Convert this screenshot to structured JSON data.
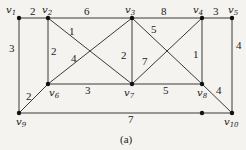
{
  "figure": {
    "caption": "(a)",
    "vertices": [
      {
        "id": "v1",
        "name": "v",
        "sub": "1",
        "x": 19,
        "y": 18,
        "lx": 6,
        "ly": 13
      },
      {
        "id": "v2",
        "name": "v",
        "sub": "2",
        "x": 48,
        "y": 18,
        "lx": 42,
        "ly": 13
      },
      {
        "id": "v3",
        "name": "v",
        "sub": "3",
        "x": 132,
        "y": 18,
        "lx": 125,
        "ly": 13
      },
      {
        "id": "v4",
        "name": "v",
        "sub": "4",
        "x": 202,
        "y": 18,
        "lx": 193,
        "ly": 13
      },
      {
        "id": "v5",
        "name": "v",
        "sub": "5",
        "x": 232,
        "y": 18,
        "lx": 228,
        "ly": 13
      },
      {
        "id": "v6",
        "name": "v",
        "sub": "6",
        "x": 48,
        "y": 84,
        "lx": 49,
        "ly": 96
      },
      {
        "id": "v7",
        "name": "v",
        "sub": "7",
        "x": 132,
        "y": 84,
        "lx": 124,
        "ly": 96
      },
      {
        "id": "v8",
        "name": "v",
        "sub": "8",
        "x": 202,
        "y": 84,
        "lx": 197,
        "ly": 96
      },
      {
        "id": "v9",
        "name": "v",
        "sub": "9",
        "x": 19,
        "y": 113,
        "lx": 16,
        "ly": 125
      },
      {
        "id": "v10",
        "name": "v",
        "sub": "10",
        "x": 232,
        "y": 113,
        "lx": 224,
        "ly": 125
      }
    ],
    "extra_points": [
      {
        "x": 202,
        "y": 113
      }
    ],
    "edges": [
      {
        "from": "v1",
        "to": "v2",
        "weight": "2",
        "wx": 30,
        "wy": 15
      },
      {
        "from": "v2",
        "to": "v3",
        "weight": "6",
        "wx": 84,
        "wy": 15
      },
      {
        "from": "v3",
        "to": "v4",
        "weight": "8",
        "wx": 161,
        "wy": 15
      },
      {
        "from": "v4",
        "to": "v5",
        "weight": "3",
        "wx": 213,
        "wy": 15
      },
      {
        "from": "v1",
        "to": "v9",
        "weight": "3",
        "wx": 9,
        "wy": 52
      },
      {
        "from": "v2",
        "to": "v6",
        "weight": "2",
        "wx": 51,
        "wy": 55
      },
      {
        "from": "v2",
        "to": "v7",
        "weight": "1",
        "wx": 69,
        "wy": 35
      },
      {
        "from": "v6",
        "to": "v3",
        "weight": "4",
        "wx": 71,
        "wy": 62
      },
      {
        "from": "v3",
        "to": "v7",
        "weight": "2",
        "wx": 121,
        "wy": 59
      },
      {
        "from": "v3",
        "to": "v8",
        "weight": "5",
        "wx": 151,
        "wy": 33
      },
      {
        "from": "v7",
        "to": "v4",
        "weight": "7",
        "wx": 142,
        "wy": 65
      },
      {
        "from": "v4",
        "to": "v8",
        "weight": "1",
        "wx": 193,
        "wy": 58
      },
      {
        "from": "v5",
        "to": "v10",
        "weight": "4",
        "wx": 236,
        "wy": 49
      },
      {
        "from": "v6",
        "to": "v9",
        "weight": "2",
        "wx": 26,
        "wy": 100
      },
      {
        "from": "v6",
        "to": "v7",
        "weight": "3",
        "wx": 85,
        "wy": 94
      },
      {
        "from": "v7",
        "to": "v8",
        "weight": "5",
        "wx": 163,
        "wy": 94
      },
      {
        "from": "v8",
        "to": "v10",
        "weight": "4",
        "wx": 216,
        "wy": 94
      },
      {
        "from": "v9",
        "to": "v10",
        "weight": "7",
        "wx": 128,
        "wy": 123
      }
    ]
  }
}
